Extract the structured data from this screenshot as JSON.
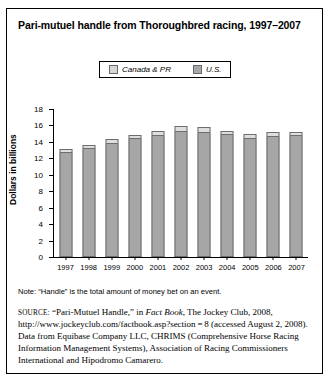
{
  "figure": {
    "title": "Pari-mutuel handle from Thoroughbred racing, 1997–2007",
    "note": "Note: “Handle” is the total amount of money bet on an event.",
    "source": {
      "keyword": "SOURCE:",
      "line1": " “Pari-Mutuel Handle,” in ",
      "italic1": "Fact Book",
      "line2": ", The Jockey Club, 2008, http://www.jockeyclub.com/factbook.asp?section = 8 (accessed August 2, 2008). Data from Equibase Company LLC, CHRIMS (Comprehensive Horse Racing Information Management Systems), Association of Racing Commissioners International and Hipodromo Camarero."
    }
  },
  "chart_data": {
    "type": "bar",
    "stacked": true,
    "title": "Pari-mutuel handle from Thoroughbred racing, 1997–2007",
    "xlabel": "",
    "ylabel": "Dollars in billions",
    "ylim": [
      0,
      18
    ],
    "ytick_step": 2,
    "yticks": [
      18,
      16,
      14,
      12,
      10,
      8,
      6,
      4,
      2,
      0
    ],
    "grid": false,
    "legend_position": "top-center",
    "categories": [
      "1997",
      "1998",
      "1999",
      "2000",
      "2001",
      "2002",
      "2003",
      "2004",
      "2005",
      "2006",
      "2007"
    ],
    "series": [
      {
        "name": "U.S.",
        "color": "#a6a6a6",
        "values": [
          12.6,
          13.1,
          13.8,
          14.4,
          14.7,
          15.2,
          15.1,
          14.8,
          14.4,
          14.6,
          14.7
        ]
      },
      {
        "name": "Canada & PR",
        "color": "#dedede",
        "values": [
          0.5,
          0.5,
          0.5,
          0.5,
          0.6,
          0.7,
          0.7,
          0.5,
          0.6,
          0.6,
          0.5
        ]
      }
    ],
    "totals": [
      13.1,
      13.6,
      14.3,
      14.9,
      15.3,
      15.9,
      15.8,
      15.3,
      15.0,
      15.2,
      15.2
    ]
  },
  "legend": {
    "items": [
      {
        "label": "Canada & PR",
        "swatch": "#d6d6d6"
      },
      {
        "label": "U.S.",
        "swatch": "#a8a8a8"
      }
    ]
  }
}
